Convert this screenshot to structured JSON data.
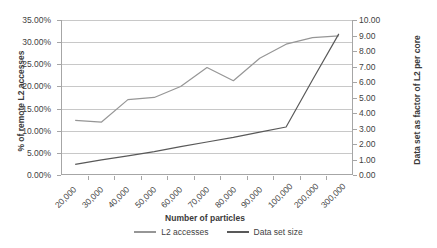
{
  "chart_data": {
    "type": "line",
    "title": "",
    "xlabel": "Number of particles",
    "ylabel": "% of remote L2 accesses",
    "y2label": "Data set as factor of L2 per core",
    "grid": true,
    "legend_position": "bottom",
    "categories": [
      "20,000",
      "30,000",
      "40,000",
      "50,000",
      "60,000",
      "70,000",
      "80,000",
      "90,000",
      "100,000",
      "200,000",
      "300,000"
    ],
    "ylim": [
      0,
      35
    ],
    "yticks": [
      "0.00%",
      "5.00%",
      "10.00%",
      "15.00%",
      "20.00%",
      "25.00%",
      "30.00%",
      "35.00%"
    ],
    "ytick_values": [
      0,
      5,
      10,
      15,
      20,
      25,
      30,
      35
    ],
    "y2lim": [
      0,
      10
    ],
    "y2ticks": [
      "0.00",
      "1.00",
      "2.00",
      "3.00",
      "4.00",
      "5.00",
      "6.00",
      "7.00",
      "8.00",
      "9.00",
      "10.00"
    ],
    "y2tick_values": [
      0,
      1,
      2,
      3,
      4,
      5,
      6,
      7,
      8,
      9,
      10
    ],
    "series": [
      {
        "name": "L2 accesses",
        "axis": "left",
        "color": "#969696",
        "values": [
          12.2,
          11.8,
          16.9,
          17.4,
          19.9,
          24.2,
          21.2,
          26.3,
          29.5,
          31.0,
          31.4
        ]
      },
      {
        "name": "Data set size",
        "axis": "right",
        "color": "#595959",
        "values": [
          0.62,
          0.92,
          1.18,
          1.45,
          1.78,
          2.08,
          2.38,
          2.72,
          3.05,
          6.1,
          9.1
        ]
      }
    ]
  },
  "axes": {
    "x_title": "Number of particles",
    "y_left_title": "% of remote L2 accesses",
    "y_right_title": "Data set as factor of L2 per core"
  },
  "legend": {
    "items": [
      {
        "label": "L2 accesses",
        "color": "#969696"
      },
      {
        "label": "Data set size",
        "color": "#595959"
      }
    ]
  },
  "colors": {
    "grid": "#c8c8c8",
    "axis": "#a6a6a6",
    "text": "#3f3f3f",
    "background": "#ffffff"
  }
}
